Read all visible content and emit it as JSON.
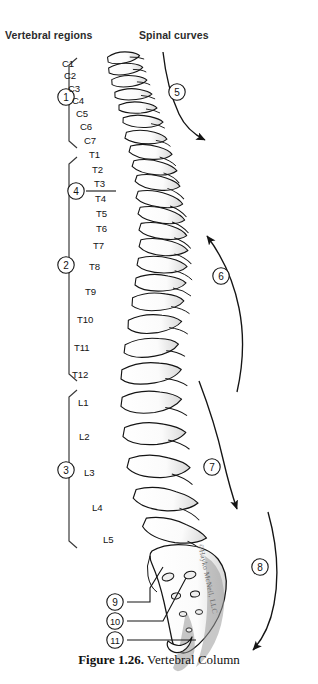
{
  "figure": {
    "caption_label": "Figure 1.26.",
    "caption_title": "Vertebral Column",
    "watermark": "©Hayko McNeil, LLC"
  },
  "headers": {
    "left": "Vertebral regions",
    "right": "Spinal curves"
  },
  "vertebrae": [
    {
      "label": "C1",
      "x": 62,
      "y": 64
    },
    {
      "label": "C2",
      "x": 64,
      "y": 76
    },
    {
      "label": "C3",
      "x": 68,
      "y": 89
    },
    {
      "label": "C4",
      "x": 72,
      "y": 101
    },
    {
      "label": "C5",
      "x": 76,
      "y": 114
    },
    {
      "label": "C6",
      "x": 80,
      "y": 127
    },
    {
      "label": "C7",
      "x": 84,
      "y": 141
    },
    {
      "label": "T1",
      "x": 89,
      "y": 155
    },
    {
      "label": "T2",
      "x": 92,
      "y": 170
    },
    {
      "label": "T3",
      "x": 94,
      "y": 184
    },
    {
      "label": "T4",
      "x": 95,
      "y": 199
    },
    {
      "label": "T5",
      "x": 96,
      "y": 214
    },
    {
      "label": "T6",
      "x": 96,
      "y": 229
    },
    {
      "label": "T7",
      "x": 93,
      "y": 246
    },
    {
      "label": "T8",
      "x": 89,
      "y": 267
    },
    {
      "label": "T9",
      "x": 85,
      "y": 292
    },
    {
      "label": "T10",
      "x": 77,
      "y": 320
    },
    {
      "label": "T11",
      "x": 74,
      "y": 348
    },
    {
      "label": "T12",
      "x": 72,
      "y": 375
    },
    {
      "label": "L1",
      "x": 78,
      "y": 403
    },
    {
      "label": "L2",
      "x": 79,
      "y": 437
    },
    {
      "label": "L3",
      "x": 84,
      "y": 473
    },
    {
      "label": "L4",
      "x": 92,
      "y": 508
    },
    {
      "label": "L5",
      "x": 103,
      "y": 540
    }
  ],
  "region_brackets": [
    {
      "number": "1",
      "name": "cervical-region",
      "top": 58,
      "bottom": 148,
      "cx": 66,
      "cy": 97
    },
    {
      "number": "2",
      "name": "thoracic-region",
      "top": 157,
      "bottom": 381,
      "cx": 66,
      "cy": 265
    },
    {
      "number": "3",
      "name": "lumbar-region",
      "top": 390,
      "bottom": 548,
      "cx": 66,
      "cy": 470
    }
  ],
  "callouts": [
    {
      "number": "4",
      "name": "callout-4-vertebra-detail",
      "cx": 76,
      "cy": 191
    },
    {
      "number": "5",
      "name": "callout-5-cervical-curve",
      "cx": 177,
      "cy": 92
    },
    {
      "number": "6",
      "name": "callout-6-thoracic-curve",
      "cx": 221,
      "cy": 276
    },
    {
      "number": "7",
      "name": "callout-7-lumbar-curve",
      "cx": 212,
      "cy": 467
    },
    {
      "number": "8",
      "name": "callout-8-sacral-curve",
      "cx": 260,
      "cy": 567
    },
    {
      "number": "9",
      "name": "callout-9-sacrum",
      "cx": 115,
      "cy": 602
    },
    {
      "number": "10",
      "name": "callout-10-sacral-foramen",
      "cx": 115,
      "cy": 621
    },
    {
      "number": "11",
      "name": "callout-11-coccyx",
      "cx": 115,
      "cy": 640
    }
  ],
  "colors": {
    "ink": "#141414",
    "bone_fill": "#ffffff",
    "shade": "#9b9b9b",
    "watermark": "#6b6b6b"
  }
}
